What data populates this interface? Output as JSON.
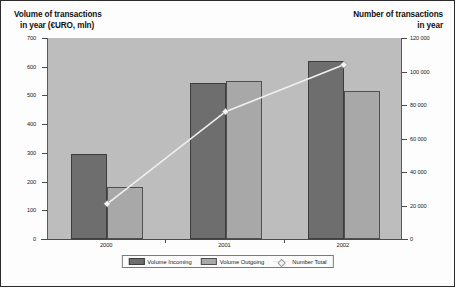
{
  "chart_data": {
    "type": "bar",
    "title": "",
    "categories": [
      "2000",
      "2001",
      "2002"
    ],
    "series": [
      {
        "name": "Volume Incoming",
        "axis": "left",
        "color": "#6e6e6e",
        "values": [
          295,
          545,
          620
        ]
      },
      {
        "name": "Volume Outgoing",
        "axis": "left",
        "color": "#a8a8a8",
        "values": [
          180,
          550,
          515
        ]
      },
      {
        "name": "Number Total",
        "axis": "right",
        "color": "#f2f2f2",
        "type": "line",
        "values": [
          21000,
          76000,
          104000
        ]
      }
    ],
    "xlabel": "",
    "ylabel": "Volume of transactions in year (€URO, mln)",
    "y2label": "Number of transactions in year",
    "ylim": [
      0,
      700
    ],
    "y2lim": [
      0,
      120000
    ],
    "yticks": [
      "0",
      "100",
      "200",
      "300",
      "400",
      "500",
      "600",
      "700"
    ],
    "y2ticks": [
      "0",
      "20 000",
      "40 000",
      "60 000",
      "80 000",
      "100 000",
      "120 000"
    ],
    "grid": false,
    "legend_position": "bottom"
  },
  "titles": {
    "left_line1": "Volume of transactions",
    "left_line2": "in year (€URO, mln)",
    "right_line1": "Number of transactions",
    "right_line2": "in year"
  },
  "legend": {
    "items": [
      {
        "label": "Volume Incoming"
      },
      {
        "label": "Volume Outgoing"
      },
      {
        "label": "Number Total"
      }
    ]
  }
}
